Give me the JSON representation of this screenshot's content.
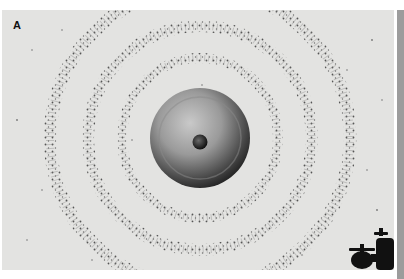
{
  "figure": {
    "panel_label": "A",
    "colors": {
      "background": "#e3e3e1",
      "particles": "#5a5a5a",
      "bell_dark": "#2a2a2a",
      "bell_light": "#b8b8b8",
      "faucet": "#111111",
      "edge_strip": "#9c9c9c"
    }
  }
}
